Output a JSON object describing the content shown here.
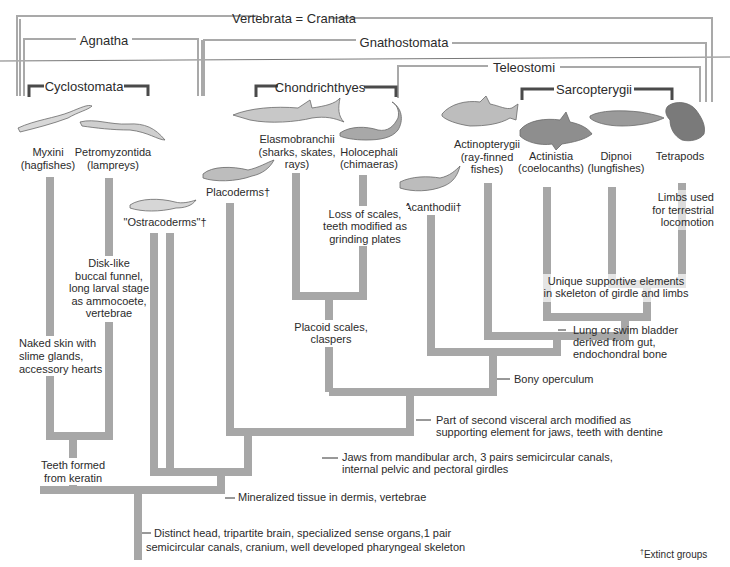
{
  "clade_brackets": {
    "vertebrata": "Vertebrata = Craniata",
    "agnatha": "Agnatha",
    "gnathostomata": "Gnathostomata",
    "cyclostomata": "Cyclostomata",
    "chondrichthyes": "Chondrichthyes",
    "teleostomi": "Teleostomi",
    "sarcopterygii": "Sarcopterygii"
  },
  "taxa": [
    {
      "name": "Myxini",
      "common": "(hagfishes)",
      "icon": "hagfish-icon"
    },
    {
      "name": "Petromyzontida",
      "common": "(lampreys)",
      "icon": "lamprey-icon"
    },
    {
      "name": "\"Ostracoderms\"†",
      "common": "",
      "icon": "ostracoderm-icon"
    },
    {
      "name": "Placoderms†",
      "common": "",
      "icon": "placoderm-icon"
    },
    {
      "name": "Elasmobranchii",
      "common": "(sharks, skates,",
      "common2": "rays)",
      "icon": "shark-icon"
    },
    {
      "name": "Holocephali",
      "common": "(chimaeras)",
      "icon": "chimaera-icon"
    },
    {
      "name": "Acanthodii†",
      "common": "",
      "icon": "acanthodian-icon"
    },
    {
      "name": "Actinopterygii",
      "common": "(ray-finned",
      "common2": "fishes)",
      "icon": "perch-icon"
    },
    {
      "name": "Actinistia",
      "common": "(coelocanths)",
      "icon": "coelacanth-icon"
    },
    {
      "name": "Dipnoi",
      "common": "(lungfishes)",
      "icon": "lungfish-icon"
    },
    {
      "name": "Tetrapods",
      "common": "",
      "icon": "frog-icon"
    }
  ],
  "characters": {
    "hagfish": [
      "Naked skin with",
      "slime glands,",
      "accessory hearts"
    ],
    "lamprey": [
      "Disk-like",
      "buccal funnel,",
      "long larval stage",
      "as ammocoete,",
      "vertebrae"
    ],
    "cyclostomata": [
      "Teeth formed",
      "from keratin"
    ],
    "holocephali": [
      "Loss of scales,",
      "teeth modified as",
      "grinding plates"
    ],
    "chondrichthyes": [
      "Placoid scales,",
      "claspers"
    ],
    "tetrapods": [
      "Limbs used",
      "for terrestrial",
      "locomotion"
    ],
    "sarcopterygii": [
      "Unique supportive elements",
      "in skeleton of girdle and limbs"
    ],
    "lung": [
      "Lung or swim bladder",
      "derived from gut,",
      "endochondral bone"
    ],
    "teleostomi": [
      "Bony operculum"
    ],
    "second_arch": [
      "Part of second visceral arch modified as",
      "supporting element for jaws, teeth with dentine"
    ],
    "jaws": [
      "Jaws from mandibular arch, 3 pairs semicircular canals,",
      "internal pelvic and pectoral girdles"
    ],
    "mineralized": [
      "Mineralized tissue in dermis, vertebrae"
    ],
    "vertebrata": [
      "Distinct head, tripartite brain, specialized sense organs,1 pair",
      "semicircular canals, cranium, well developed pharyngeal skeleton"
    ]
  },
  "footnote": "Extinct groups",
  "footnote_mark": "†",
  "colors": {
    "branch": "#a7a7a7",
    "frame_light": "#a9a9a9",
    "frame_dark": "#4a4a4a",
    "text": "#2b2b2b",
    "background": "#ffffff"
  }
}
